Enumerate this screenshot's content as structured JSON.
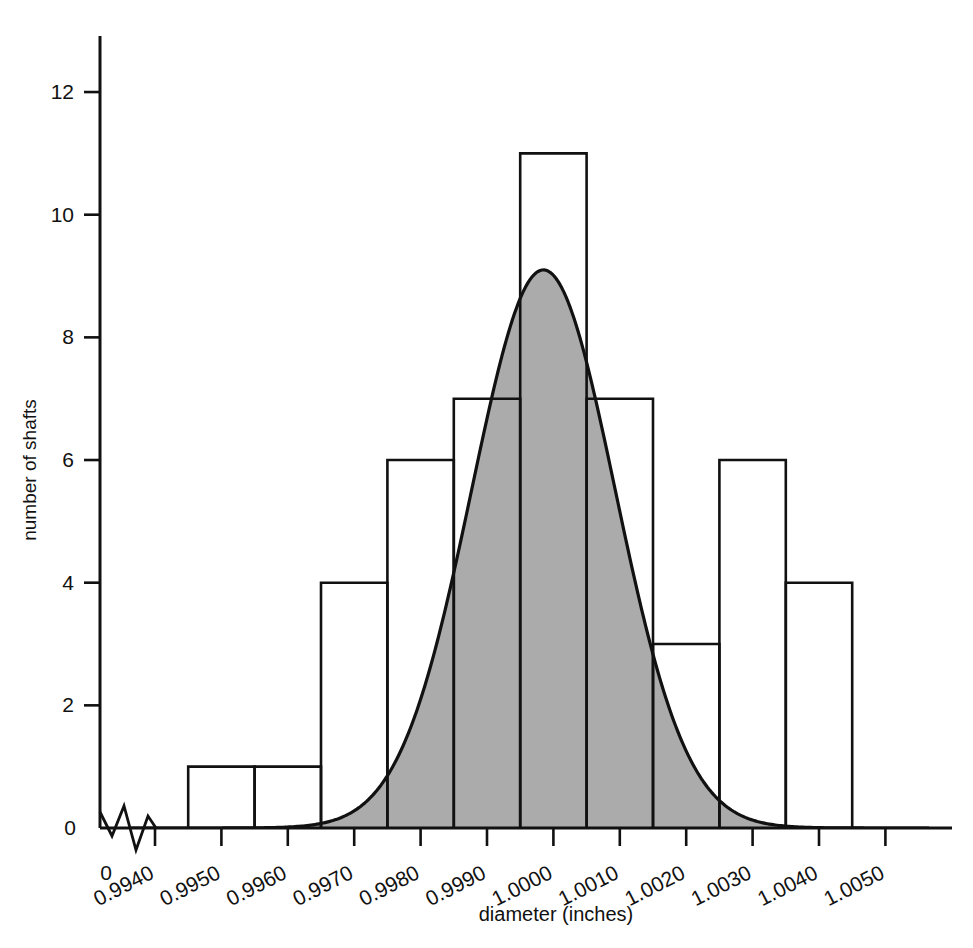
{
  "chart_data": {
    "type": "bar",
    "title": "",
    "subtitle": "",
    "xlabel": "diameter (inches)",
    "ylabel": "number of shafts",
    "grid": false,
    "legend": "none",
    "annotations": [
      "axis break between 0 and 0.9940 on x-axis"
    ],
    "x_tick_labels": [
      "0",
      "0.9940",
      "0.9950",
      "0.9960",
      "0.9970",
      "0.9980",
      "0.9990",
      "1.0000",
      "1.0010",
      "1.0020",
      "1.0030",
      "1.0040",
      "1.0050"
    ],
    "y_tick_labels": [
      "0",
      "2",
      "4",
      "6",
      "8",
      "10",
      "12"
    ],
    "y_ticks": [
      0,
      2,
      4,
      6,
      8,
      10,
      12
    ],
    "ylim": [
      0,
      12.6
    ],
    "xlim": [
      0.99365,
      1.00565
    ],
    "bin_width": 0.001,
    "categories": [
      "0.9940-0.9950",
      "0.9950-0.9960",
      "0.9960-0.9970",
      "0.9970-0.9980",
      "0.9980-0.9990",
      "0.9990-1.0000",
      "1.0000-1.0010",
      "1.0010-1.0020",
      "1.0020-1.0030",
      "1.0030-1.0040"
    ],
    "bin_edges": [
      0.9945,
      0.9955,
      0.9965,
      0.9975,
      0.9985,
      0.9995,
      1.0005,
      1.0015,
      1.0025,
      1.0035,
      1.0045
    ],
    "values": [
      1,
      1,
      4,
      6,
      7,
      11,
      7,
      3,
      6,
      4
    ],
    "series": [
      {
        "name": "number of shafts",
        "values": [
          1,
          1,
          4,
          6,
          7,
          11,
          7,
          3,
          6,
          4
        ]
      },
      {
        "name": "fitted normal curve",
        "type": "line",
        "peak_value": 9.1,
        "peak_x": 0.99985,
        "mean": 0.99985,
        "std": 0.00108,
        "shaded": true
      }
    ],
    "colors": {
      "bar_outline": "#111111",
      "bar_fill": "#ffffff",
      "curve_fill": "#ababab",
      "curve_line": "#111111",
      "axis": "#111111",
      "background": "#ffffff"
    }
  }
}
